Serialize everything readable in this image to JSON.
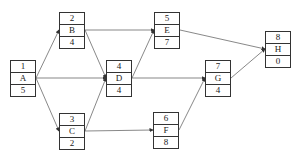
{
  "diagram": {
    "type": "activity-on-node network",
    "nodes": [
      {
        "id": "1",
        "label": "A",
        "value": "5",
        "x": 10,
        "y": 60
      },
      {
        "id": "2",
        "label": "B",
        "value": "4",
        "x": 59,
        "y": 12
      },
      {
        "id": "3",
        "label": "C",
        "value": "2",
        "x": 59,
        "y": 113
      },
      {
        "id": "4",
        "label": "D",
        "value": "4",
        "x": 106,
        "y": 60
      },
      {
        "id": "5",
        "label": "E",
        "value": "7",
        "x": 154,
        "y": 12
      },
      {
        "id": "6",
        "label": "F",
        "value": "8",
        "x": 153,
        "y": 112
      },
      {
        "id": "7",
        "label": "G",
        "value": "4",
        "x": 205,
        "y": 60
      },
      {
        "id": "8",
        "label": "H",
        "value": "0",
        "x": 265,
        "y": 31
      }
    ],
    "edges": [
      [
        "1",
        "2"
      ],
      [
        "1",
        "4"
      ],
      [
        "1",
        "3"
      ],
      [
        "2",
        "4"
      ],
      [
        "2",
        "5"
      ],
      [
        "3",
        "4"
      ],
      [
        "3",
        "6"
      ],
      [
        "4",
        "5"
      ],
      [
        "4",
        "7"
      ],
      [
        "5",
        "8"
      ],
      [
        "6",
        "7"
      ],
      [
        "7",
        "8"
      ]
    ],
    "colors": {
      "line": "#333333",
      "background": "#ffffff"
    }
  }
}
